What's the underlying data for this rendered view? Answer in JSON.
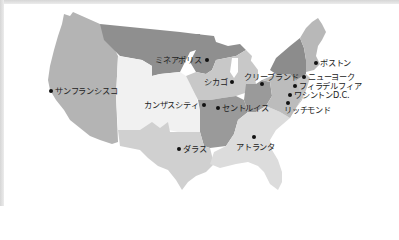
{
  "map": {
    "title": "United States cities map",
    "colors": {
      "frame": "#d9d9d9",
      "west": "#b4b4b4",
      "north": "#8f8f8f",
      "plains": "#f1f1f1",
      "midwest": "#c8c8c8",
      "south": "#d0d0d0",
      "southeast": "#dcdcdc",
      "dark_central": "#9a9a9a",
      "northeast_dark": "#8c8c8c",
      "northeast_light": "#b8b8b8",
      "atlantic": "#c4c4c4",
      "dot": "#111111",
      "label": "#222222"
    },
    "cities": [
      {
        "id": "san-francisco",
        "label": "サンフランシスコ"
      },
      {
        "id": "minneapolis",
        "label": "ミネアポリス"
      },
      {
        "id": "chicago",
        "label": "シカゴ"
      },
      {
        "id": "cleveland",
        "label": "クリーブランド"
      },
      {
        "id": "boston",
        "label": "ボストン"
      },
      {
        "id": "new-york",
        "label": "ニューヨーク"
      },
      {
        "id": "philadelphia",
        "label": "フィラデルフィア"
      },
      {
        "id": "washington-dc",
        "label": "ワシントンD.C."
      },
      {
        "id": "richmond",
        "label": "リッチモンド"
      },
      {
        "id": "kansas-city",
        "label": "カンザスシティ"
      },
      {
        "id": "st-louis",
        "label": "セントルイス"
      },
      {
        "id": "dallas",
        "label": "ダラス"
      },
      {
        "id": "atlanta",
        "label": "アトランタ"
      }
    ]
  }
}
